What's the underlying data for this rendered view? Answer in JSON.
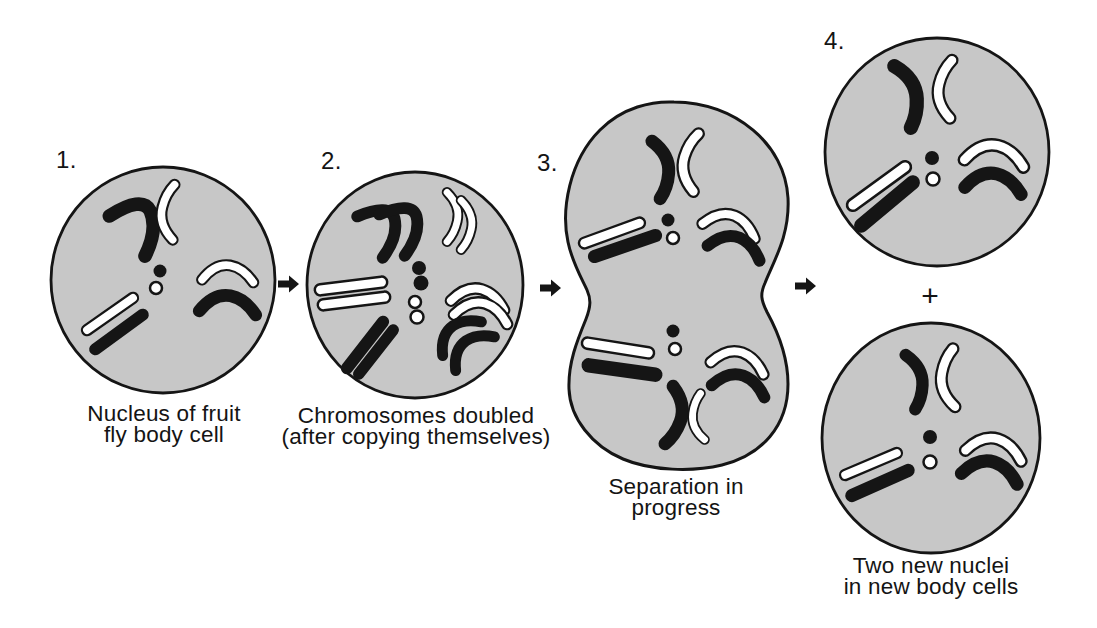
{
  "stages": [
    {
      "number": "1.",
      "caption": [
        "Nucleus of fruit",
        "fly body cell"
      ],
      "copies_per_chromosome": 1,
      "nuclei_shown": 1
    },
    {
      "number": "2.",
      "caption": [
        "Chromosomes doubled",
        "(after copying themselves)"
      ],
      "copies_per_chromosome": 2,
      "nuclei_shown": 1
    },
    {
      "number": "3.",
      "caption": [
        "Separation in",
        "progress"
      ],
      "copies_per_chromosome": 1,
      "nuclei_shown": 2
    },
    {
      "number": "4.",
      "caption": [
        "Two new nuclei",
        "in new body cells"
      ],
      "copies_per_chromosome": 1,
      "nuclei_shown": 2
    }
  ],
  "chromosome_set": [
    "v-shaped-black",
    "v-shaped-white",
    "rod-black",
    "rod-white",
    "curved-black",
    "curved-white",
    "dot-black",
    "dot-white"
  ],
  "connectors": {
    "plus_sign": "+",
    "arrow_icon": "right-arrow",
    "arrow_count": 3
  },
  "colors": {
    "background": "#ffffff",
    "cell_fill": "#c7c7c7",
    "outline": "#151515",
    "chromosome_black": "#151515",
    "chromosome_white": "#ffffff",
    "text": "#141414"
  }
}
